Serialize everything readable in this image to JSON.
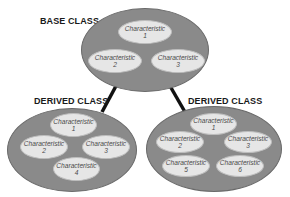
{
  "diagram": {
    "type": "class inheritance",
    "colors": {
      "class_fill": "#8a8a8a",
      "characteristic_fill": "#e6e6e6",
      "connector": "#111111",
      "text": "#1a1a1a"
    },
    "base_class": {
      "title": "BASE CLASS",
      "characteristics": [
        {
          "label": "Characteristic",
          "number": "1"
        },
        {
          "label": "Characteristic",
          "number": "2"
        },
        {
          "label": "Characteristic",
          "number": "3"
        }
      ]
    },
    "derived_left": {
      "title": "DERIVED CLASS",
      "characteristics": [
        {
          "label": "Characteristic",
          "number": "1"
        },
        {
          "label": "Characteristic",
          "number": "2"
        },
        {
          "label": "Characteristic",
          "number": "3"
        },
        {
          "label": "Characteristic",
          "number": "4"
        }
      ]
    },
    "derived_right": {
      "title": "DERIVED CLASS",
      "characteristics": [
        {
          "label": "Characteristic",
          "number": "1"
        },
        {
          "label": "Characteristic",
          "number": "2"
        },
        {
          "label": "Characteristic",
          "number": "3"
        },
        {
          "label": "Characteristic",
          "number": "5"
        },
        {
          "label": "Characteristic",
          "number": "6"
        }
      ]
    }
  }
}
